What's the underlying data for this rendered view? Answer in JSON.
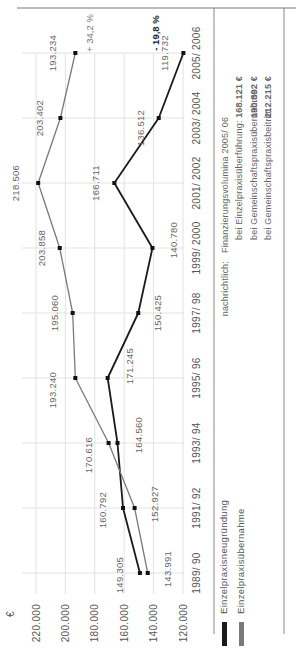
{
  "chart_data": {
    "type": "line",
    "title": "",
    "unit": "€",
    "xlabel": "",
    "ylabel": "€",
    "ylim": [
      120000,
      220000
    ],
    "y_ticks": [
      "220.000",
      "200.000",
      "180.000",
      "160.000",
      "140.000",
      "120.000"
    ],
    "categories": [
      "1989/ 90",
      "1991/ 92",
      "1993/ 94",
      "1995/ 96",
      "1997/ 98",
      "1999/ 2000",
      "2001/ 2002",
      "2003/ 2004",
      "2005/ 2006"
    ],
    "series": [
      {
        "name": "Einzelpraxisneugründung",
        "color": "#1a1a1a",
        "values": [
          149305,
          160792,
          164560,
          171245,
          150425,
          140780,
          166711,
          136512,
          119732
        ],
        "labels": [
          "149.305",
          "160.792",
          "164.560",
          "171.245",
          "150.425",
          "140.780",
          "166.711",
          "136.512",
          "119.732"
        ],
        "change_label": "- 19,8 %"
      },
      {
        "name": "Einzelpraxisübernahme",
        "color": "#7a7a7a",
        "values": [
          143991,
          152927,
          170616,
          193240,
          195060,
          203858,
          218506,
          203402,
          193234
        ],
        "labels": [
          "143.991",
          "152.927",
          "170.616",
          "193.240",
          "195.060",
          "203.858",
          "218.506",
          "203.402",
          "193.234"
        ],
        "change_label": "+ 34,2 %"
      }
    ],
    "grid": true,
    "legend_position": "bottom-left",
    "annotations": {
      "note_prefix": "nachrichtlich:",
      "note_title": "Finanzierungsvolumina 2005/ 06",
      "rows": [
        {
          "label": "bei Einzelpraxisüberführung:",
          "value": "168.121 €"
        },
        {
          "label": "bei Gemeinschaftspraxisübernahme:",
          "value": "190.892 €"
        },
        {
          "label": "bei Gemeinschaftspraxisbeitritt:",
          "value": "212.215 €"
        }
      ]
    }
  }
}
